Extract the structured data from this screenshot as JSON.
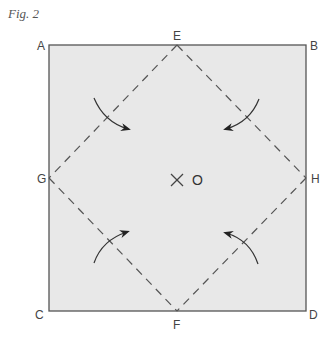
{
  "figure": {
    "title": "Fig. 2",
    "colors": {
      "fill": "#e8e8e8",
      "border": "#555555",
      "dash": "#555555",
      "arrow": "#333333",
      "label": "#444444"
    },
    "corners": {
      "A": "A",
      "B": "B",
      "C": "C",
      "D": "D"
    },
    "midpoints": {
      "E": "E",
      "F": "F",
      "G": "G",
      "H": "H"
    },
    "center": {
      "marker": "×",
      "label": "O"
    },
    "arrows": [
      {
        "id": "top-left",
        "direction": "inward-down-right"
      },
      {
        "id": "top-right",
        "direction": "inward-down-left"
      },
      {
        "id": "bottom-left",
        "direction": "inward-up-right"
      },
      {
        "id": "bottom-right",
        "direction": "inward-up-left"
      }
    ]
  }
}
